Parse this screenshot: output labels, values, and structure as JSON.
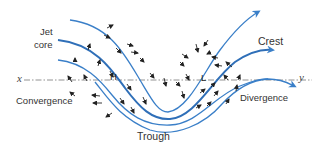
{
  "diagram": {
    "labels": {
      "jet_core_line1": "Jet",
      "jet_core_line2": "core",
      "crest": "Crest",
      "trough": "Trough",
      "convergence": "Convergence",
      "divergence": "Divergence",
      "high": "H",
      "low": "L",
      "axis_start": "x",
      "axis_end": "y"
    },
    "colors": {
      "streamline": "#3a7fc8",
      "jet_core": "#2f6fb8",
      "wind_arrow": "#222222",
      "axis_line": "#777777",
      "text": "#333333"
    },
    "streamline_count": 4
  }
}
